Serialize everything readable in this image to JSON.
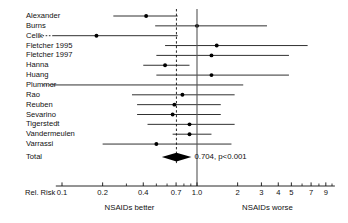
{
  "chart_data": {
    "type": "forest",
    "title": "",
    "xlabel": "Rel. Risk",
    "ylabel": "",
    "xscale": "log",
    "xlim": [
      0.09,
      10.5
    ],
    "grid": false,
    "null_line": 1.0,
    "summary_line": 0.704,
    "axis_label": "Rel. Risk",
    "tick_labels": [
      "0.1",
      "0.2",
      "0.4",
      "0.7",
      "1.0",
      "2",
      "3",
      "4",
      "5",
      "7",
      "9"
    ],
    "tick_values": [
      0.1,
      0.2,
      0.4,
      0.7,
      1.0,
      2,
      3,
      4,
      5,
      7,
      9
    ],
    "minor_ticks": [
      0.3,
      0.5,
      0.6,
      0.8,
      0.9,
      6,
      8,
      10
    ],
    "left_footer": "NSAIDs better",
    "right_footer": "NSAIDs worse",
    "summary_label": "0.704, p<0.001",
    "summary": {
      "name": "Total",
      "estimate": 0.704,
      "ci_low": 0.64,
      "ci_high": 0.78,
      "p_value": "p<0.001"
    },
    "categories": [
      "Alexander",
      "Burns",
      "Celik",
      "Fletcher 1995",
      "Fletcher 1997",
      "Hanna",
      "Huang",
      "Plummer",
      "Rao",
      "Reuben",
      "Sevarino",
      "Tigerstedt",
      "Vandermeulen",
      "Varrassi",
      "Total"
    ],
    "studies": [
      {
        "name": "Alexander",
        "estimate": 0.42,
        "ci_low": 0.24,
        "ci_high": 0.72,
        "truncated_left": false,
        "truncated_right": false
      },
      {
        "name": "Burns",
        "estimate": 1.0,
        "ci_low": 0.49,
        "ci_high": 3.3,
        "truncated_left": false,
        "truncated_right": false
      },
      {
        "name": "Celik",
        "estimate": 0.18,
        "ci_low": 0.085,
        "ci_high": 0.72,
        "truncated_left": true,
        "truncated_right": false
      },
      {
        "name": "Fletcher 1995",
        "estimate": 1.4,
        "ci_low": 0.58,
        "ci_high": 6.6,
        "truncated_left": false,
        "truncated_right": false
      },
      {
        "name": "Fletcher 1997",
        "estimate": 1.28,
        "ci_low": 0.5,
        "ci_high": 4.8,
        "truncated_left": false,
        "truncated_right": false
      },
      {
        "name": "Hanna",
        "estimate": 0.58,
        "ci_low": 0.4,
        "ci_high": 0.88,
        "truncated_left": false,
        "truncated_right": false
      },
      {
        "name": "Huang",
        "estimate": 1.28,
        "ci_low": 0.5,
        "ci_high": 4.8,
        "truncated_left": false,
        "truncated_right": false
      },
      {
        "name": "Plummer",
        "estimate": null,
        "ci_low": 0.085,
        "ci_high": 2.2,
        "truncated_left": true,
        "truncated_right": false
      },
      {
        "name": "Rao",
        "estimate": 0.78,
        "ci_low": 0.33,
        "ci_high": 1.9,
        "truncated_left": false,
        "truncated_right": false
      },
      {
        "name": "Reuben",
        "estimate": 0.68,
        "ci_low": 0.36,
        "ci_high": 1.5,
        "truncated_left": false,
        "truncated_right": false
      },
      {
        "name": "Sevarino",
        "estimate": 0.66,
        "ci_low": 0.36,
        "ci_high": 1.5,
        "truncated_left": false,
        "truncated_right": false
      },
      {
        "name": "Tigerstedt",
        "estimate": 0.88,
        "ci_low": 0.43,
        "ci_high": 1.9,
        "truncated_left": false,
        "truncated_right": false
      },
      {
        "name": "Vandermeulen",
        "estimate": 0.88,
        "ci_low": 0.66,
        "ci_high": 1.28,
        "truncated_left": false,
        "truncated_right": false
      },
      {
        "name": "Varrassi",
        "estimate": 0.5,
        "ci_low": 0.2,
        "ci_high": 1.8,
        "truncated_left": false,
        "truncated_right": false
      }
    ]
  }
}
